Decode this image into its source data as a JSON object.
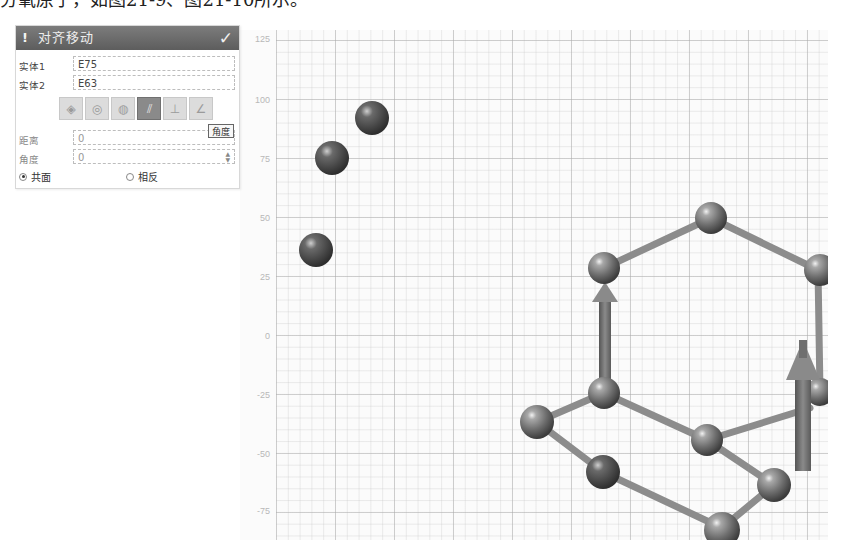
{
  "caption": {
    "text": "分氧原子，如图21-9、图21-10所示。"
  },
  "panel": {
    "title": "对齐移动",
    "warn_icon": "!",
    "confirm_icon": "✓",
    "fields": [
      {
        "label": "实体1",
        "value": "E75"
      },
      {
        "label": "实体2",
        "value": "E63"
      }
    ],
    "toolbar": {
      "tools": [
        {
          "name": "align-face-tool",
          "glyph": "◈",
          "active": false
        },
        {
          "name": "align-center-tool",
          "glyph": "◎",
          "active": false
        },
        {
          "name": "align-axis-tool",
          "glyph": "◍",
          "active": false
        },
        {
          "name": "align-parallel-tool",
          "glyph": "⫽",
          "active": true
        },
        {
          "name": "align-point-tool",
          "glyph": "⊥",
          "active": false
        },
        {
          "name": "align-angle-tool",
          "glyph": "∠",
          "active": false
        }
      ],
      "tooltip": "角度"
    },
    "params": [
      {
        "label": "距离",
        "value": "0"
      },
      {
        "label": "角度",
        "value": "0"
      }
    ],
    "radios": [
      {
        "label": "共面",
        "selected": true
      },
      {
        "label": "相反",
        "selected": false
      }
    ]
  },
  "viewport": {
    "y_axis_labels": [
      "125",
      "100",
      "75",
      "50",
      "25",
      "0",
      "-25",
      "-50",
      "-75"
    ],
    "atom_color": "#707070",
    "bond_color": "#8a8a8a",
    "arrow_color": "#7a7a7a"
  }
}
